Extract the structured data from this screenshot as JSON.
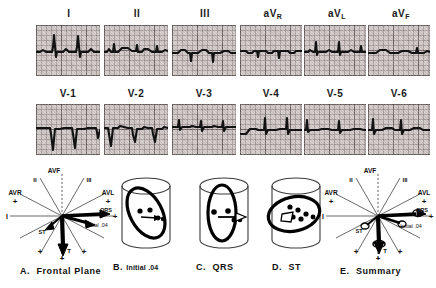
{
  "figure": {
    "type": "ecg-12-lead-with-vector-diagrams"
  },
  "ecg": {
    "row1": [
      {
        "label": "I",
        "sub": ""
      },
      {
        "label": "II",
        "sub": ""
      },
      {
        "label": "III",
        "sub": ""
      },
      {
        "label": "aV",
        "sub": "R"
      },
      {
        "label": "aV",
        "sub": "L"
      },
      {
        "label": "aV",
        "sub": "F"
      }
    ],
    "row2": [
      {
        "label": "V-1",
        "sub": ""
      },
      {
        "label": "V-2",
        "sub": ""
      },
      {
        "label": "V-3",
        "sub": ""
      },
      {
        "label": "V-4",
        "sub": ""
      },
      {
        "label": "V-5",
        "sub": ""
      },
      {
        "label": "V-6",
        "sub": ""
      }
    ]
  },
  "panels": {
    "a": {
      "letter": "A.",
      "title": "Frontal Plane",
      "axis_labels": [
        "AVF",
        "II",
        "III",
        "AVR",
        "AVL",
        "I",
        "ST",
        "T"
      ],
      "vector_labels": [
        "QRS",
        "Initial .04",
        "ST",
        "T"
      ],
      "plus_marks": 5
    },
    "b": {
      "letter": "B.",
      "title": "Initial .04"
    },
    "c": {
      "letter": "C.",
      "title": "QRS"
    },
    "d": {
      "letter": "D.",
      "title": "ST"
    },
    "e": {
      "letter": "E.",
      "title": "Summary",
      "axis_labels": [
        "AVF",
        "II",
        "III",
        "AVR",
        "AVL",
        "I"
      ],
      "vector_labels": [
        "QRS",
        "Initial .04",
        "ST",
        "T"
      ]
    }
  },
  "colors": {
    "paper": "#cfc8c6",
    "grid_minor": "#6e5f5f",
    "grid_major": "#463a3a",
    "trace": "#121212",
    "ink": "#111111",
    "background": "#ffffff"
  }
}
